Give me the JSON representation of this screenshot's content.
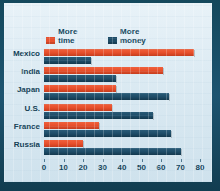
{
  "chart_data": {
    "type": "bar",
    "orientation": "horizontal",
    "title": "",
    "xlabel": "",
    "ylabel": "",
    "xlim": [
      0,
      80
    ],
    "grid": false,
    "legend_position": "top-left",
    "xticks": [
      0,
      10,
      20,
      30,
      40,
      50,
      60,
      70,
      80
    ],
    "xtick_labels": [
      "0",
      "10",
      "20",
      "30",
      "40",
      "50",
      "60",
      "70",
      "80"
    ],
    "categories": [
      "Mexico",
      "India",
      "Japan",
      "U.S.",
      "France",
      "Russia"
    ],
    "series": [
      {
        "name": "More time",
        "color": "#e8502e",
        "values": [
          77,
          61,
          37,
          35,
          28,
          20
        ]
      },
      {
        "name": "More money",
        "color": "#1d4b66",
        "values": [
          24,
          37,
          64,
          56,
          65,
          70
        ]
      }
    ]
  },
  "legend": {
    "items": [
      {
        "top": "More",
        "bottom": "time",
        "swatch": "orange-swatch-icon"
      },
      {
        "top": "More",
        "bottom": "money",
        "swatch": "blue-swatch-icon"
      }
    ]
  },
  "colors": {
    "series_time": "#e8502e",
    "series_money": "#1d4b66",
    "panel_background": "#dceaf2",
    "frame": "#14485c",
    "text": "#14455c"
  }
}
